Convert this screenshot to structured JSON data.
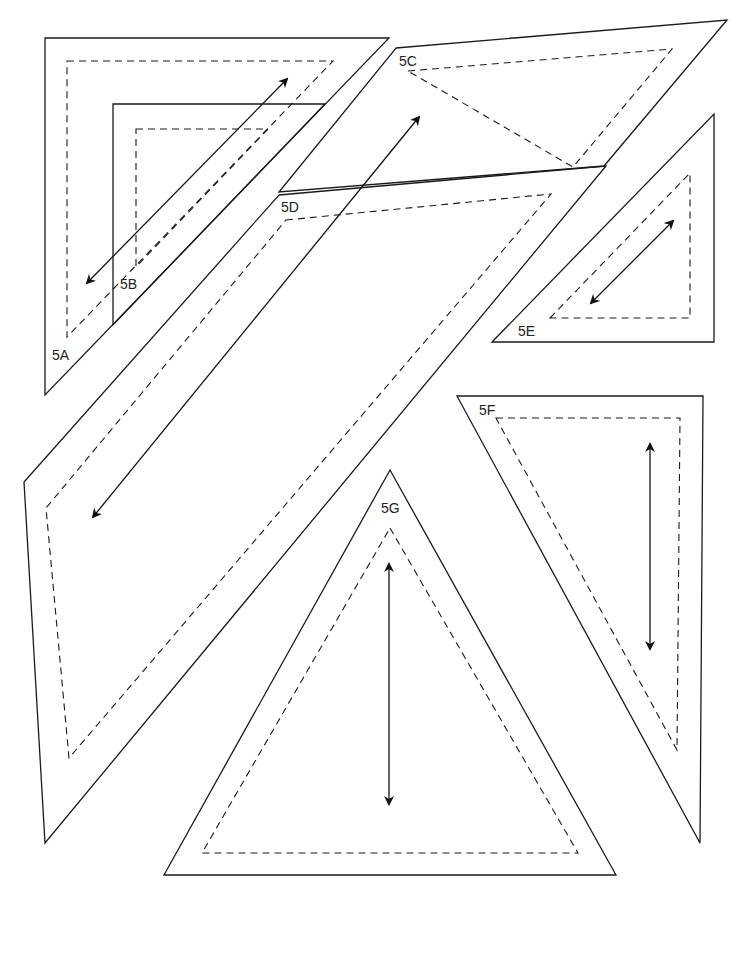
{
  "diagram": {
    "type": "sewing-pattern-layout",
    "colors": {
      "line": "#1a1a1a",
      "background": "#ffffff"
    },
    "pieces": [
      {
        "id": "5A",
        "label": "5A",
        "label_pos": [
          52,
          360
        ],
        "cut": [
          [
            45,
            38
          ],
          [
            389,
            38
          ],
          [
            45,
            395
          ]
        ],
        "seam": [
          [
            67,
            61
          ],
          [
            333,
            61
          ],
          [
            67,
            337
          ]
        ],
        "grain": [
          [
            87,
            283
          ],
          [
            287,
            79
          ]
        ]
      },
      {
        "id": "5B",
        "label": "5B",
        "label_pos": [
          120,
          289
        ],
        "cut": [
          [
            113,
            104
          ],
          [
            325,
            104
          ],
          [
            113,
            325
          ]
        ],
        "seam": [
          [
            136,
            129
          ],
          [
            268,
            129
          ],
          [
            136,
            267
          ]
        ],
        "grain": null
      },
      {
        "id": "5C",
        "label": "5C",
        "label_pos": [
          399,
          66
        ],
        "cut": [
          [
            396,
            48
          ],
          [
            727,
            20
          ],
          [
            604,
            166
          ],
          [
            279,
            192
          ]
        ],
        "seam": [
          [
            408,
            71
          ],
          [
            672,
            49
          ],
          [
            573,
            167
          ]
        ],
        "grain": [
          [
            93,
            517
          ],
          [
            419,
            117
          ]
        ]
      },
      {
        "id": "5D",
        "label": "5D",
        "label_pos": [
          281,
          212
        ],
        "cut": [
          [
            279,
            195
          ],
          [
            606,
            166
          ],
          [
            45,
            843
          ],
          [
            24,
            482
          ]
        ],
        "seam": [
          [
            286,
            220
          ],
          [
            551,
            194
          ],
          [
            69,
            758
          ],
          [
            46,
            508
          ]
        ],
        "grain": null
      },
      {
        "id": "5E",
        "label": "5E",
        "label_pos": [
          518,
          336
        ],
        "cut": [
          [
            492,
            342
          ],
          [
            714,
            114
          ],
          [
            714,
            342
          ]
        ],
        "seam": [
          [
            550,
            318
          ],
          [
            690,
            173
          ],
          [
            690,
            318
          ]
        ],
        "grain": [
          [
            591,
            303
          ],
          [
            673,
            221
          ]
        ]
      },
      {
        "id": "5F",
        "label": "5F",
        "label_pos": [
          479,
          415
        ],
        "cut": [
          [
            457,
            396
          ],
          [
            703,
            396
          ],
          [
            700,
            843
          ]
        ],
        "seam": [
          [
            496,
            418
          ],
          [
            680,
            418
          ],
          [
            677,
            750
          ]
        ],
        "grain": [
          [
            650,
            444
          ],
          [
            650,
            649
          ]
        ]
      },
      {
        "id": "5G",
        "label": "5G",
        "label_pos": [
          381,
          513
        ],
        "cut": [
          [
            390,
            470
          ],
          [
            616,
            875
          ],
          [
            164,
            875
          ]
        ],
        "seam": [
          [
            390,
            528
          ],
          [
            578,
            853
          ],
          [
            202,
            853
          ]
        ],
        "grain": [
          [
            389,
            564
          ],
          [
            389,
            804
          ]
        ]
      }
    ]
  }
}
